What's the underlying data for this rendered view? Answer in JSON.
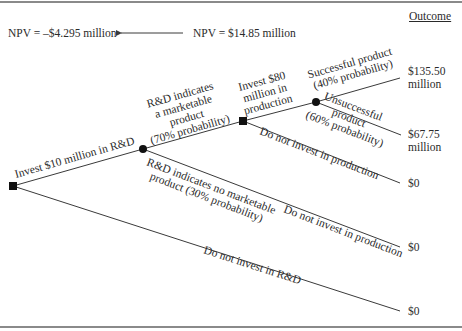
{
  "header": {
    "outcome_label": "Outcome",
    "npv_rd": "NPV = –$4.295 million",
    "npv_production": "NPV = $14.85 million"
  },
  "branches": {
    "invest_rd": "Invest $10 million in R&D",
    "no_invest_rd": "Do not invest in R&D",
    "marketable": [
      "R&D indicates",
      "a marketable",
      "product",
      "(70% probability)"
    ],
    "not_marketable": [
      "R&D indicates no marketable",
      "product (30% probability)"
    ],
    "invest_production": [
      "Invest $80",
      "million in",
      "production"
    ],
    "no_invest_production_upper": "Do not invest in production",
    "no_invest_production_lower": "Do not invest in production",
    "successful": [
      "Successful product",
      "(40% probability)"
    ],
    "unsuccessful": [
      "Unsuccessful",
      "product",
      "(60% probability)"
    ]
  },
  "outcomes": {
    "successful": [
      "$135.50",
      "million"
    ],
    "unsuccessful": [
      "$67.75",
      "million"
    ],
    "no_production": "$0",
    "no_marketable": "$0",
    "no_rd": "$0"
  },
  "nodes": {
    "root": {
      "type": "decision",
      "shape": "square"
    },
    "rd_result": {
      "type": "chance",
      "shape": "circle"
    },
    "production_decision": {
      "type": "decision",
      "shape": "square"
    },
    "market_result": {
      "type": "chance",
      "shape": "circle"
    }
  },
  "colors": {
    "line": "#3a3a3a",
    "node": "#111111",
    "rule": "#8a8a8a"
  }
}
